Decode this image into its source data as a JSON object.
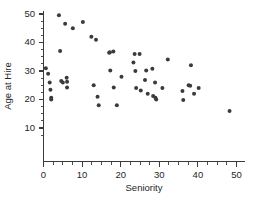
{
  "chart_data": {
    "type": "scatter",
    "title": "",
    "xlabel": "Seniority",
    "ylabel": "Age at Hire",
    "xlim": [
      0,
      52
    ],
    "ylim": [
      0,
      52
    ],
    "grid": false,
    "legend": null,
    "x_ticks": [
      0,
      10,
      20,
      30,
      40,
      50
    ],
    "x_tick_labels": [
      "0",
      "10",
      "20",
      "30",
      "40",
      "50"
    ],
    "x_minor_step": 2.5,
    "y_ticks": [
      10,
      20,
      30,
      40,
      50
    ],
    "y_tick_labels": [
      "10",
      "20",
      "30",
      "40",
      "50"
    ],
    "y_minor_step": 2.5,
    "marker": "circle",
    "marker_color": "#3b3b3b",
    "marker_size": 2.0,
    "points": [
      [
        0.6,
        31.0
      ],
      [
        1.2,
        29.0
      ],
      [
        1.6,
        26.0
      ],
      [
        1.8,
        23.4
      ],
      [
        2.0,
        20.6
      ],
      [
        2.0,
        20.0
      ],
      [
        4.0,
        49.6
      ],
      [
        4.3,
        37.0
      ],
      [
        4.6,
        26.5
      ],
      [
        5.0,
        26.0
      ],
      [
        5.6,
        46.6
      ],
      [
        6.0,
        27.6
      ],
      [
        6.1,
        26.2
      ],
      [
        6.1,
        24.2
      ],
      [
        7.6,
        45.0
      ],
      [
        10.2,
        47.2
      ],
      [
        12.4,
        42.0
      ],
      [
        13.0,
        25.0
      ],
      [
        13.6,
        41.0
      ],
      [
        14.0,
        21.0
      ],
      [
        14.3,
        18.0
      ],
      [
        17.0,
        36.4
      ],
      [
        17.2,
        36.6
      ],
      [
        17.3,
        30.2
      ],
      [
        18.1,
        36.8
      ],
      [
        18.2,
        24.2
      ],
      [
        19.0,
        18.0
      ],
      [
        20.2,
        28.0
      ],
      [
        23.3,
        33.0
      ],
      [
        23.6,
        36.0
      ],
      [
        23.8,
        30.0
      ],
      [
        24.0,
        24.0
      ],
      [
        24.9,
        36.0
      ],
      [
        25.2,
        23.2
      ],
      [
        26.3,
        26.8
      ],
      [
        26.6,
        30.2
      ],
      [
        27.0,
        22.0
      ],
      [
        28.2,
        30.8
      ],
      [
        28.4,
        21.2
      ],
      [
        28.9,
        26.0
      ],
      [
        29.0,
        20.6
      ],
      [
        29.2,
        20.0
      ],
      [
        30.8,
        24.0
      ],
      [
        32.2,
        34.0
      ],
      [
        36.0,
        23.0
      ],
      [
        36.2,
        19.8
      ],
      [
        37.6,
        25.0
      ],
      [
        38.0,
        24.8
      ],
      [
        38.2,
        32.0
      ],
      [
        39.0,
        22.0
      ],
      [
        40.2,
        24.0
      ],
      [
        48.2,
        16.0
      ]
    ]
  },
  "axes": {
    "x_axis_name": "seniority-axis",
    "y_axis_name": "age-at-hire-axis"
  }
}
